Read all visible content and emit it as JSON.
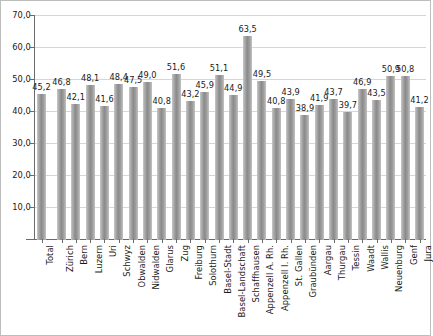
{
  "chart_data": {
    "type": "bar",
    "title": "",
    "xlabel": "",
    "ylabel": "",
    "ylim": [
      0,
      70
    ],
    "ytick_labels": [
      "70,0",
      "60,0",
      "50,0",
      "40,0",
      "30,0",
      "20,0",
      "10,0",
      "-"
    ],
    "ytick_values": [
      70,
      60,
      50,
      40,
      30,
      20,
      10,
      0
    ],
    "grid": true,
    "legend": "none",
    "decimal_separator": ",",
    "categories": [
      "Total",
      "Zürich",
      "Bern",
      "Luzern",
      "Uri",
      "Schwyz",
      "Obwalden",
      "Nidwalden",
      "Glarus",
      "Zug",
      "Freiburg",
      "Solothurn",
      "Basel-Stadt",
      "Basel-Landschaft",
      "Schaffhausen",
      "Appenzell A. Rh.",
      "Appenzell I. Rh.",
      "St. Gallen",
      "Graubünden",
      "Aargau",
      "Thurgau",
      "Tessin",
      "Waadt",
      "Wallis",
      "Neuenburg",
      "Genf",
      "Jura"
    ],
    "values": [
      45.2,
      46.8,
      42.1,
      48.1,
      41.6,
      48.4,
      47.5,
      49.0,
      40.8,
      51.6,
      43.2,
      45.9,
      51.1,
      44.9,
      63.5,
      49.5,
      40.8,
      43.9,
      38.9,
      41.9,
      43.7,
      39.7,
      46.9,
      43.5,
      50.9,
      50.8,
      41.2
    ],
    "value_labels": [
      "45,2",
      "46,8",
      "42,1",
      "48,1",
      "41,6",
      "48,4",
      "47,5",
      "49,0",
      "40,8",
      "51,6",
      "43,2",
      "45,9",
      "51,1",
      "44,9",
      "63,5",
      "49,5",
      "40,8",
      "43,9",
      "38,9",
      "41,9",
      "43,7",
      "39,7",
      "46,9",
      "43,5",
      "50,9",
      "50,8",
      "41,2"
    ],
    "colors": {
      "bar": "#8a8a8a",
      "bar_light": "#c9c9c9",
      "grid": "#d6d6d6",
      "axis": "#6b6b6b",
      "text": "#1a1a1a",
      "background": "#ffffff",
      "border": "#bdbdbd"
    }
  }
}
